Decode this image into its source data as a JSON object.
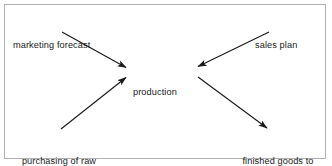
{
  "diagram": {
    "type": "flow-diagram",
    "shape": "converging-diverging-x",
    "border_color": "#b0b0b0",
    "background_color": "#ffffff",
    "line_color": "#1a1a1a",
    "text_color": "#1a1a1a",
    "nodes": {
      "marketing_forecast": {
        "label": "marketing forecast",
        "position": "top-left",
        "role": "input"
      },
      "sales_plan": {
        "label": "sales plan",
        "position": "top-right",
        "role": "input"
      },
      "production": {
        "label": "production",
        "position": "center",
        "role": "process"
      },
      "purchasing_raw_materials": {
        "line1": "purchasing of raw",
        "line2": "materials",
        "position": "bottom-left",
        "role": "input"
      },
      "finished_goods": {
        "line1": "finished goods to",
        "line2": "dispatch warehouse",
        "position": "bottom-right",
        "role": "output"
      }
    },
    "edges": [
      {
        "name": "marketing-forecast-to-production",
        "from": "marketing forecast",
        "to": "production",
        "direction": "down-right",
        "arrowhead": "end",
        "x1": 62,
        "y1": 32,
        "x2": 127,
        "y2": 68
      },
      {
        "name": "sales-plan-to-production",
        "from": "sales plan",
        "to": "production",
        "direction": "down-left",
        "arrowhead": "end",
        "x1": 269,
        "y1": 32,
        "x2": 197,
        "y2": 67
      },
      {
        "name": "purchasing-to-production",
        "from": "purchasing of raw materials",
        "to": "production",
        "direction": "up-right",
        "arrowhead": "end",
        "x1": 61,
        "y1": 129,
        "x2": 127,
        "y2": 77
      },
      {
        "name": "production-to-finished-goods",
        "from": "production",
        "to": "finished goods to dispatch warehouse",
        "direction": "down-right",
        "arrowhead": "end",
        "x1": 198,
        "y1": 77,
        "x2": 268,
        "y2": 129
      }
    ]
  }
}
